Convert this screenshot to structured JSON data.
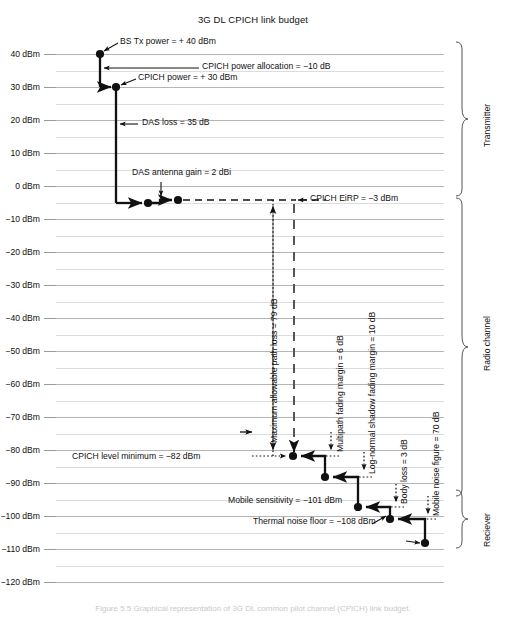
{
  "title": "3G DL CPICH link budget",
  "caption": "Figure 5.5   Graphical representation of 3G DL  common pilot channel (CPICH) link budget.",
  "axis": {
    "unit": "dBm",
    "ticks": [
      {
        "label": "40 dBm",
        "value": 40
      },
      {
        "label": "30 dBm",
        "value": 30
      },
      {
        "label": "20 dBm",
        "value": 20
      },
      {
        "label": "10 dBm",
        "value": 10
      },
      {
        "label": "0 dBm",
        "value": 0
      },
      {
        "label": "−10 dBm",
        "value": -10
      },
      {
        "label": "−20 dBm",
        "value": -20
      },
      {
        "label": "−30 dBm",
        "value": -30
      },
      {
        "label": "−40 dBm",
        "value": -40
      },
      {
        "label": "−50 dBm",
        "value": -50
      },
      {
        "label": "−60 dBm",
        "value": -60
      },
      {
        "label": "−70 dBm",
        "value": -70
      },
      {
        "label": "−80 dBm",
        "value": -80
      },
      {
        "label": "−90 dBm",
        "value": -90
      },
      {
        "label": "−100 dBm",
        "value": -100
      },
      {
        "label": "−110 dBm",
        "value": -110
      },
      {
        "label": "−120 dBm",
        "value": -120
      }
    ]
  },
  "annotations": {
    "bs_tx_power": "BS Tx power = + 40 dBm",
    "cpich_power_allocation": "CPICH power allocation = −10 dB",
    "cpich_power": "CPICH power = + 30 dBm",
    "das_loss": "DAS loss = 35 dB",
    "das_antenna_gain": "DAS antenna gain = 2 dBi",
    "cpich_eirp": "CPICH EiRP = −3 dBm",
    "max_path_loss": "Maximum allowable path loss = 79 dB",
    "multipath_fading_margin": "Multipath fading margin = 6 dB",
    "lognormal_shadow_margin": "Log-normal shadow fading margin = 10 dB",
    "body_loss": "Body loss = 3 dB",
    "mobile_noise_figure": "Mobile noise figure = 70 dB",
    "cpich_level_minimum": "CPICH level minimum = −82 dBm",
    "mobile_sensitivity": "Mobile sensitivity = −101 dBm",
    "thermal_noise_floor": "Thermal noise floor = −108 dBm"
  },
  "brackets": [
    {
      "label": "Transmitter",
      "top": 42,
      "bottom": 196
    },
    {
      "label": "Radio channel",
      "top": 198,
      "bottom": 488
    },
    {
      "label": "Reciever",
      "top": 490,
      "bottom": 548
    }
  ],
  "chart_data": {
    "type": "line",
    "title": "3G DL CPICH link budget",
    "xlabel": "",
    "ylabel": "dBm",
    "ylim": [
      -125,
      45
    ],
    "grid": true,
    "legend": "none",
    "points": [
      {
        "name": "BS Tx power",
        "value": 40,
        "unit": "dBm"
      },
      {
        "name": "CPICH power",
        "value": 30,
        "unit": "dBm"
      },
      {
        "name": "DAS output",
        "value": -5,
        "unit": "dBm"
      },
      {
        "name": "CPICH EiRP",
        "value": -3,
        "unit": "dBm"
      },
      {
        "name": "CPICH level minimum",
        "value": -82,
        "unit": "dBm"
      },
      {
        "name": "After multipath fading margin",
        "value": -88,
        "unit": "dBm"
      },
      {
        "name": "After shadow fading margin",
        "value": -98,
        "unit": "dBm"
      },
      {
        "name": "Mobile sensitivity",
        "value": -101,
        "unit": "dBm"
      },
      {
        "name": "Thermal noise floor",
        "value": -108,
        "unit": "dBm"
      }
    ],
    "deltas": [
      {
        "name": "CPICH power allocation",
        "value": -10,
        "unit": "dB"
      },
      {
        "name": "DAS loss",
        "value": -35,
        "unit": "dB"
      },
      {
        "name": "DAS antenna gain",
        "value": 2,
        "unit": "dBi"
      },
      {
        "name": "Maximum allowable path loss",
        "value": -79,
        "unit": "dB"
      },
      {
        "name": "Multipath fading margin",
        "value": -6,
        "unit": "dB"
      },
      {
        "name": "Log-normal shadow fading margin",
        "value": -10,
        "unit": "dB"
      },
      {
        "name": "Body loss",
        "value": -3,
        "unit": "dB"
      },
      {
        "name": "Mobile noise figure",
        "value": 70,
        "unit": "dB"
      }
    ]
  }
}
